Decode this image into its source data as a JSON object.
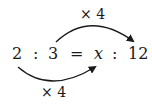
{
  "equation": {
    "left_antecedent": "2",
    "left_separator": ":",
    "left_consequent": "3",
    "equals": "=",
    "right_antecedent": "x",
    "right_separator": ":",
    "right_consequent": "12"
  },
  "arrows": {
    "top": {
      "label": "× 4",
      "from": "3",
      "to": "12"
    },
    "bottom": {
      "label": "× 4",
      "from": "2",
      "to": "x"
    }
  },
  "colors": {
    "ink": "#1a1a1a",
    "background": "#ffffff"
  }
}
